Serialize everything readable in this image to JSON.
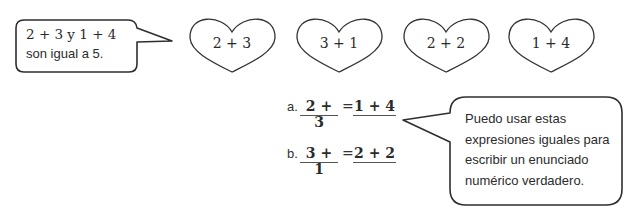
{
  "speech_bubble_left": {
    "line1": "2 + 3 y 1 + 4",
    "line2": "son igual a 5."
  },
  "hearts": [
    {
      "label": "2 + 3"
    },
    {
      "label": "3 + 1"
    },
    {
      "label": "2 + 2"
    },
    {
      "label": "1 + 4"
    }
  ],
  "equations": [
    {
      "label": "a.",
      "left": "2 + 3",
      "equals": "=",
      "right": "1 + 4"
    },
    {
      "label": "b.",
      "left": "3 + 1",
      "equals": "=",
      "right": "2 + 2"
    }
  ],
  "speech_bubble_right": {
    "line1": "Puedo usar estas",
    "line2": "expresiones iguales para",
    "line3": "escribir un enunciado",
    "line4": "numérico verdadero."
  }
}
